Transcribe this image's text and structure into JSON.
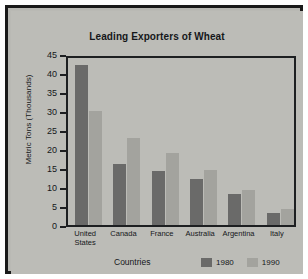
{
  "chart_data": {
    "type": "bar",
    "title": "Leading Exporters of Wheat",
    "xlabel": "Countries",
    "ylabel": "Metric Tons\n(Thousands)",
    "categories": [
      "United\nStates",
      "Canada",
      "France",
      "Australia",
      "Argentina",
      "Italy"
    ],
    "series": [
      {
        "name": "1980",
        "color": "#6a6a69",
        "values": [
          42,
          16,
          14.2,
          12.2,
          8.2,
          3.1
        ]
      },
      {
        "name": "1990",
        "color": "#a3a39e",
        "values": [
          30,
          23,
          19,
          14.4,
          9.2,
          4.2
        ]
      }
    ],
    "ylim": [
      0,
      45
    ],
    "yticks": [
      "0",
      "5",
      "10",
      "15",
      "20",
      "25",
      "30",
      "35",
      "40",
      "45"
    ],
    "grid": false,
    "legend_position": "bottom-right"
  }
}
